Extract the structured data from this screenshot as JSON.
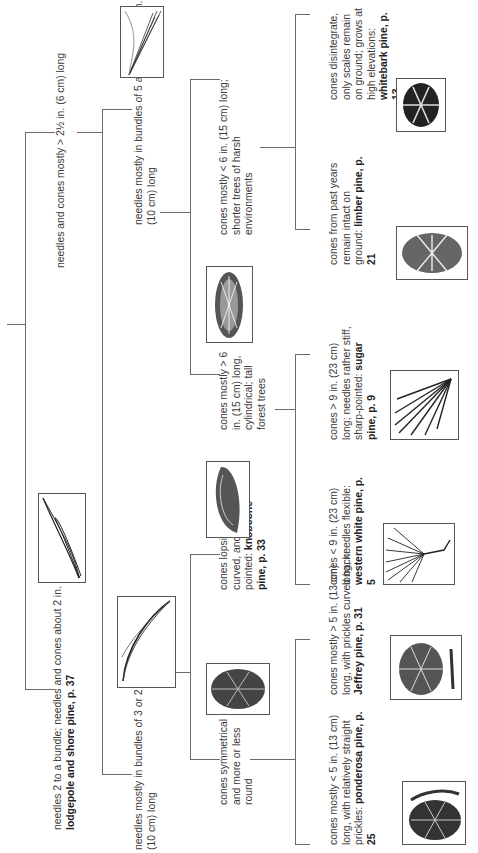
{
  "diagram": {
    "type": "dichotomous-key",
    "orientation": "rotated 90 degrees counterclockwise",
    "nodes": {
      "n1a": {
        "text": "needles 2 to a bundle; needles and cones about 2 in. (5 cm) long: ",
        "species": "lodgepole and shore pine, p. 37",
        "image": "two-needle-bundle-icon"
      },
      "n1b": {
        "text": "needles and cones mostly > 2½ in. (6 cm) long"
      },
      "n2a": {
        "text": "needles mostly in bundles of 5 and mostly < 4 in. (10 cm) long",
        "image": "five-needle-bundle-icon"
      },
      "n2b": {
        "text": "needles mostly in bundles of 3 or 2 and mostly > 4 in. (10 cm) long",
        "image": "three-needle-bundle-icon"
      },
      "n3a": {
        "text": "cones mostly < 6 in. (15 cm) long; shorter trees of harsh environments"
      },
      "n3b": {
        "text": "cones mostly > 6 in. (15 cm) long, cylindrical; tall forest trees",
        "image": "cylindrical-cone-icon"
      },
      "n3c": {
        "text": "cones lopsided, curved, and pointed: ",
        "species": "knobcone pine, p. 33",
        "image": "lopsided-cone-icon"
      },
      "n3d": {
        "text": "cones symmetrical and more or less round",
        "image": "round-cone-icon"
      },
      "n4a": {
        "text": "cones disintegrate, only scales remain on ground; grows at high elevations: ",
        "species": "whitebark pine, p. 13",
        "image": "whitebark-cone-icon"
      },
      "n4b": {
        "text": "cones from past years remain intact on ground: ",
        "species": "limber pine, p. 21",
        "image": "limber-cone-icon"
      },
      "n4c": {
        "text": "cones > 9 in. (23 cm) long; needles rather stiff, sharp-pointed: ",
        "species": "sugar pine, p. 9",
        "image": "sugar-pine-needles-icon"
      },
      "n4d": {
        "text": "cones < 9 in. (23 cm) long; needles flexible: ",
        "species": "western white pine, p. 5",
        "image": "western-white-needles-icon"
      },
      "n4e": {
        "text": "cones mostly > 5 in. (13 cm) long, with prickles curved back: ",
        "species": "Jeffrey pine, p. 31",
        "image": "jeffrey-cone-icon"
      },
      "n4f": {
        "text": "cones mostly < 5 in. (13 cm) long, with relatively straight prickles: ",
        "species": "ponderosa pine, p. 25",
        "image": "ponderosa-cone-icon"
      }
    },
    "colors": {
      "line": "#6b6b6b",
      "text": "#3a3a3a",
      "background": "#ffffff"
    }
  }
}
